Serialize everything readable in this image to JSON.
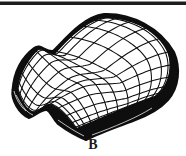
{
  "figure": {
    "label": "B",
    "colors": {
      "ink": "#0e0e0e",
      "paper": "#ffffff",
      "rule_dark": "#1d1d1d",
      "rule_light": "#909090",
      "label_ink": "#1a1a1a"
    },
    "mesh": {
      "grid_lines_u": 13,
      "grid_lines_v": 14,
      "stroke_width": 1.05,
      "outline_width": 1.5,
      "silhouette_stroke": 2,
      "corners": {
        "A": [
          17,
          89
        ],
        "B": [
          105,
          17
        ],
        "C": [
          155,
          97
        ],
        "D": [
          76,
          129
        ]
      },
      "edges": {
        "AB": {
          "start": [
            17,
            89
          ],
          "segments": [
            [
              19,
              74,
              27,
              60,
              37,
              50
            ],
            [
              43,
              46,
              47,
              54,
              55,
              53
            ],
            [
              68,
              38,
              85,
              21,
              105,
              17
            ]
          ]
        },
        "BC": {
          "start": [
            105,
            17
          ],
          "segments": [
            [
              138,
              18,
              160,
              34,
              168,
              52
            ],
            [
              174,
              68,
              168,
              88,
              155,
              97
            ]
          ]
        },
        "AD": {
          "start": [
            17,
            89
          ],
          "segments": [
            [
              21,
              101,
              26,
              110,
              33,
              112
            ],
            [
              40,
              112,
              45,
              104,
              51,
              105
            ],
            [
              59,
              108,
              69,
              119,
              76,
              129
            ]
          ]
        },
        "DC": {
          "start": [
            76,
            129
          ],
          "segments": [
            [
              98,
              120,
              126,
              107,
              155,
              97
            ]
          ]
        }
      },
      "silhouette_path": "M 12.5,90 C 14,71 22,57 34,48 C 41,43 45,52 53,51 C 67,37 83,17 104,14 C 132,13 160,28 174,52 C 181,68 179,88 168,100 C 159,110 147,116 133,121 C 117,127 99,133 86,140 C 76,136 66,130 58,124 C 52,118 51,112 47,110 C 41,109 36,116 29,118 C 19,114 11,100 12.5,90 Z",
      "band_streaks": [
        "M 16,95 C 22,106 26,112 33,115",
        "M 14,91 C 16,99 20,106 26,111",
        "M 58,120 C 68,127 76,132 84,136",
        "M 92,135 C 114,127 136,118 152,108"
      ]
    }
  }
}
